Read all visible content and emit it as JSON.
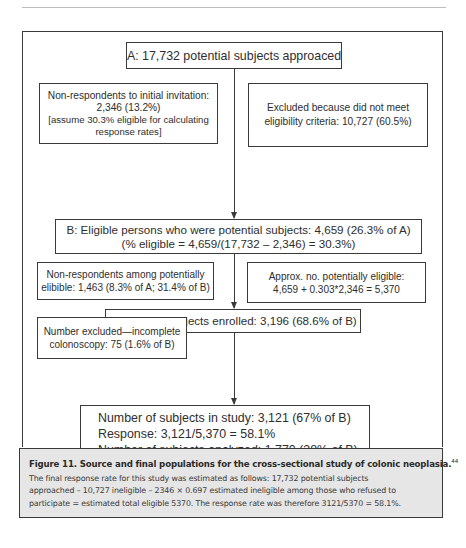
{
  "diagram": {
    "nodes": {
      "a": {
        "lines": [
          "A: 17,732 potential subjects approaced"
        ]
      },
      "nonrespondents_initial": {
        "lines": [
          "Non-respondents to initial invitation:",
          "2,346 (13.2%)",
          "[assume 30.3% eligible for calculating",
          "response rates]"
        ]
      },
      "excluded_criteria": {
        "lines": [
          "Excluded because did not meet",
          "eligibility criteria: 10,727 (60.5%)"
        ]
      },
      "b": {
        "lines": [
          "B: Eligible persons who were potential subjects: 4,659 (26.3% of A)",
          "(% eligible = 4,659/(17,732 – 2,346) = 30.3%)"
        ]
      },
      "nonrespondents_eligible": {
        "lines": [
          "Non-respondents among potentially",
          "elibible: 1,463 (8.3% of A; 31.4% of B)"
        ]
      },
      "approx_eligible": {
        "lines": [
          "Approx. no. potentially eligible:",
          "4,659 + 0.303*2,346 = 5,370"
        ]
      },
      "enrolled": {
        "lines": [
          "Number of subjects enrolled: 3,196 (68.6% of B)"
        ]
      },
      "excluded_colonoscopy": {
        "lines": [
          "Number excluded—incomplete",
          "colonoscopy: 75 (1.6% of B)"
        ]
      },
      "final": {
        "lines": [
          "Number of subjects in study: 3,121 (67% of B)",
          "Response: 3,121/5,370 = 58.1%",
          "Number of subjects analyzed: 1,770 (38% of B)"
        ]
      }
    },
    "edges": [
      {
        "from": "a",
        "to": "b"
      },
      {
        "from": "b",
        "to": "enrolled"
      },
      {
        "from": "enrolled",
        "to": "final"
      }
    ]
  },
  "caption": {
    "title": "Figure 11. Source and final populations for the cross-sectional study of colonic neoplasia.",
    "ref": "44",
    "body_lines": [
      "The final response rate for this study was estimated as follows: 17,732 potential subjects",
      "approached – 10,727 ineligible – 2346 × 0.697 estimated ineligible among those who refused to",
      "participate = estimated total eligible 5370. The response rate was therefore 3121/5370 = 58.1%."
    ]
  }
}
